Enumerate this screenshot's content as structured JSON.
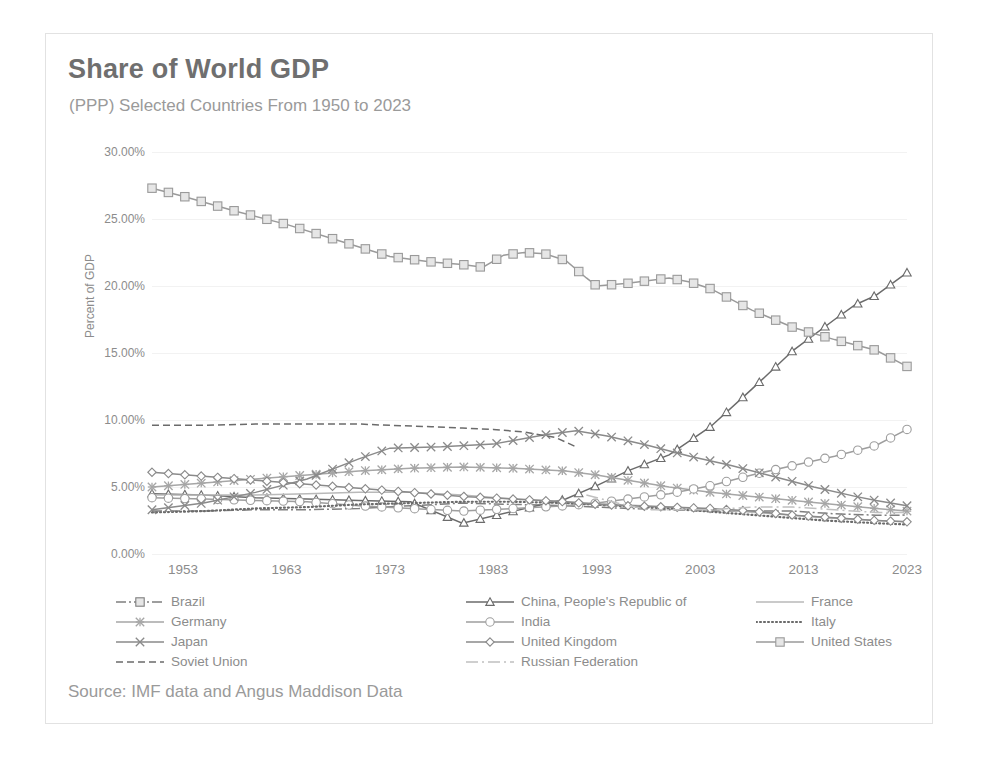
{
  "title": "Share of World GDP",
  "subtitle": "(PPP) Selected Countries From 1950 to 2023",
  "source": "Source: IMF data and Angus Maddison Data",
  "axis": {
    "ylabel": "Percent of GDP"
  },
  "chart_data": {
    "type": "line",
    "title": "Share of World GDP",
    "subtitle": "(PPP) Selected Countries From 1950 to 2023",
    "xlabel": "",
    "ylabel": "Percent of GDP",
    "xlim": [
      1950,
      2023
    ],
    "ylim": [
      0,
      30
    ],
    "ytick_labels": [
      "0.00%",
      "5.00%",
      "10.00%",
      "15.00%",
      "20.00%",
      "25.00%",
      "30.00%"
    ],
    "ytick_values": [
      0,
      5,
      10,
      15,
      20,
      25,
      30
    ],
    "xtick_labels": [
      "1953",
      "1963",
      "1973",
      "1983",
      "1993",
      "2003",
      "2013",
      "2023"
    ],
    "xtick_values": [
      1953,
      1963,
      1973,
      1983,
      1993,
      2003,
      2013,
      2023
    ],
    "grid": true,
    "legend_position": "bottom",
    "series": [
      {
        "name": "Brazil",
        "color": "#7f7f7f",
        "dash": "10 3 2 3",
        "marker": "none",
        "x": [
          1950,
          1955,
          1960,
          1965,
          1970,
          1975,
          1980,
          1985,
          1990,
          1993,
          1996,
          2000,
          2004,
          2008,
          2012,
          2016,
          2020,
          2023
        ],
        "y": [
          3.2,
          3.2,
          3.3,
          3.3,
          3.4,
          3.6,
          3.8,
          3.7,
          3.6,
          3.5,
          3.4,
          3.3,
          3.2,
          3.2,
          3.2,
          3.0,
          2.9,
          2.9
        ]
      },
      {
        "name": "China, People's Republic of",
        "color": "#6b6b6b",
        "dash": "none",
        "marker": "triangle",
        "x": [
          1950,
          1955,
          1960,
          1965,
          1970,
          1975,
          1980,
          1985,
          1990,
          1993,
          1996,
          2000,
          2004,
          2008,
          2012,
          2016,
          2018,
          2020,
          2023
        ],
        "y": [
          4.5,
          4.4,
          4.2,
          4.1,
          4.0,
          3.9,
          2.3,
          3.2,
          4.1,
          5.1,
          6.2,
          7.4,
          9.5,
          12.3,
          15.2,
          17.5,
          18.6,
          19.3,
          21.0
        ]
      },
      {
        "name": "France",
        "color": "#b9b9b9",
        "dash": "none",
        "marker": "none",
        "x": [
          1950,
          1955,
          1960,
          1965,
          1970,
          1975,
          1980,
          1985,
          1990,
          1995,
          2000,
          2005,
          2010,
          2015,
          2020,
          2023
        ],
        "y": [
          4.4,
          4.4,
          4.4,
          4.5,
          4.6,
          4.6,
          4.4,
          4.1,
          3.9,
          3.7,
          3.5,
          3.3,
          3.0,
          2.7,
          2.5,
          2.4
        ]
      },
      {
        "name": "Germany",
        "color": "#a6a6a6",
        "dash": "none",
        "marker": "asterisk",
        "x": [
          1950,
          1955,
          1960,
          1965,
          1970,
          1975,
          1980,
          1985,
          1990,
          1993,
          1996,
          2000,
          2004,
          2008,
          2012,
          2016,
          2020,
          2023
        ],
        "y": [
          5.0,
          5.3,
          5.6,
          5.9,
          6.2,
          6.4,
          6.5,
          6.4,
          6.2,
          5.9,
          5.5,
          5.0,
          4.6,
          4.3,
          4.0,
          3.7,
          3.4,
          3.2
        ]
      },
      {
        "name": "India",
        "color": "#9e9e9e",
        "dash": "none",
        "marker": "circle",
        "x": [
          1950,
          1955,
          1960,
          1965,
          1970,
          1975,
          1980,
          1985,
          1990,
          1993,
          1996,
          2000,
          2004,
          2008,
          2012,
          2016,
          2020,
          2023
        ],
        "y": [
          4.2,
          4.1,
          4.0,
          3.9,
          3.6,
          3.4,
          3.2,
          3.4,
          3.6,
          3.8,
          4.1,
          4.5,
          5.1,
          5.9,
          6.6,
          7.3,
          8.1,
          9.3
        ]
      },
      {
        "name": "Italy",
        "color": "#6b6b6b",
        "dash": "1 3",
        "marker": "none",
        "x": [
          1950,
          1955,
          1960,
          1965,
          1970,
          1975,
          1980,
          1985,
          1990,
          1995,
          2000,
          2005,
          2010,
          2015,
          2020,
          2023
        ],
        "y": [
          3.1,
          3.2,
          3.4,
          3.5,
          3.7,
          3.8,
          3.9,
          3.9,
          3.8,
          3.6,
          3.4,
          3.1,
          2.8,
          2.5,
          2.3,
          2.2
        ]
      },
      {
        "name": "Japan",
        "color": "#8a8a8a",
        "dash": "none",
        "marker": "x",
        "x": [
          1950,
          1955,
          1960,
          1965,
          1970,
          1973,
          1978,
          1983,
          1988,
          1991,
          1994,
          1998,
          2002,
          2006,
          2010,
          2014,
          2018,
          2020,
          2023
        ],
        "y": [
          3.3,
          3.8,
          4.6,
          5.6,
          7.1,
          7.9,
          8.0,
          8.2,
          8.9,
          9.2,
          8.8,
          8.1,
          7.3,
          6.6,
          5.8,
          5.0,
          4.3,
          4.0,
          3.6
        ]
      },
      {
        "name": "United Kingdom",
        "color": "#8a8a8a",
        "dash": "none",
        "marker": "diamond",
        "x": [
          1950,
          1955,
          1960,
          1965,
          1970,
          1975,
          1980,
          1985,
          1990,
          1993,
          1996,
          2000,
          2004,
          2008,
          2012,
          2016,
          2020,
          2023
        ],
        "y": [
          6.1,
          5.8,
          5.5,
          5.2,
          4.9,
          4.6,
          4.3,
          4.1,
          3.9,
          3.7,
          3.6,
          3.5,
          3.4,
          3.2,
          2.9,
          2.7,
          2.5,
          2.4
        ]
      },
      {
        "name": "United States",
        "color": "#9a9a9a",
        "dash": "none",
        "marker": "square",
        "x": [
          1950,
          1953,
          1958,
          1963,
          1968,
          1973,
          1977,
          1980,
          1982,
          1984,
          1986,
          1988,
          1990,
          1992,
          1993,
          1996,
          2000,
          2002,
          2004,
          2008,
          2012,
          2016,
          2020,
          2023
        ],
        "y": [
          27.3,
          26.7,
          25.6,
          24.6,
          23.4,
          22.2,
          21.8,
          21.6,
          21.4,
          22.3,
          22.5,
          22.4,
          21.9,
          20.6,
          20.0,
          20.2,
          20.6,
          20.3,
          19.8,
          18.2,
          16.9,
          16.0,
          15.2,
          14.0
        ]
      },
      {
        "name": "Soviet Union",
        "color": "#6b6b6b",
        "dash": "7 4",
        "marker": "none",
        "x": [
          1950,
          1955,
          1960,
          1965,
          1970,
          1973,
          1977,
          1980,
          1983,
          1986,
          1989,
          1991
        ],
        "y": [
          9.6,
          9.6,
          9.7,
          9.7,
          9.7,
          9.6,
          9.5,
          9.4,
          9.3,
          9.1,
          8.7,
          8.0
        ]
      },
      {
        "name": "Russian Federation",
        "color": "#c0c0c0",
        "dash": "12 4 2 4",
        "marker": "none",
        "x": [
          1992,
          1995,
          1998,
          2001,
          2004,
          2008,
          2012,
          2016,
          2020,
          2023
        ],
        "y": [
          4.4,
          3.8,
          3.3,
          3.3,
          3.3,
          3.5,
          3.5,
          3.3,
          3.1,
          3.1
        ]
      }
    ]
  },
  "legend": {
    "items": [
      {
        "label": "Brazil",
        "marker": "dash-dot-marker"
      },
      {
        "label": "China, People's Republic of",
        "marker": "triangle"
      },
      {
        "label": "France",
        "marker": "line"
      },
      {
        "label": "Germany",
        "marker": "asterisk"
      },
      {
        "label": "India",
        "marker": "circle"
      },
      {
        "label": "Italy",
        "marker": "dotted"
      },
      {
        "label": "Japan",
        "marker": "x"
      },
      {
        "label": "United Kingdom",
        "marker": "diamond"
      },
      {
        "label": "United States",
        "marker": "square"
      },
      {
        "label": "Soviet Union",
        "marker": "dashed"
      },
      {
        "label": "Russian Federation",
        "marker": "dash-dot"
      }
    ]
  }
}
